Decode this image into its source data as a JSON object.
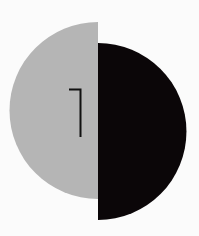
{
  "artwork": {
    "left_half": {
      "color": "#b5b5b5"
    },
    "right_half": {
      "color": "#0b0608"
    },
    "glyph": {
      "label": "7",
      "color": "#111111"
    },
    "background": "#fbfbfb"
  }
}
